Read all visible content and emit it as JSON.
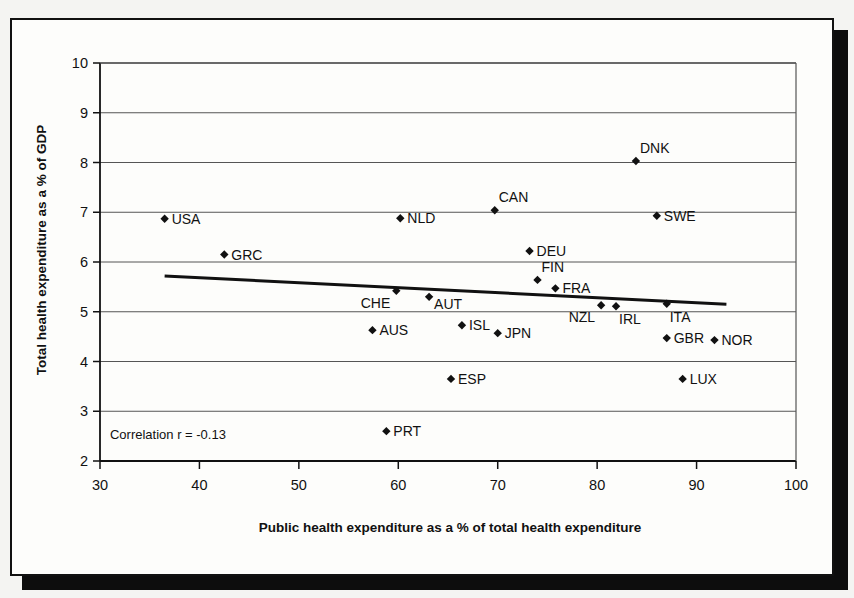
{
  "figure": {
    "background_color": "#fdfdfb",
    "border_color": "#111111",
    "annotation": "Correlation r = -0.13"
  },
  "chart_data": {
    "type": "scatter",
    "title": "",
    "xlabel": "Public health expenditure as a % of total health expenditure",
    "ylabel": "Total health expenditure as a % of GDP",
    "xlim": [
      30,
      100
    ],
    "ylim": [
      2,
      10
    ],
    "xticks": [
      30,
      40,
      50,
      60,
      70,
      80,
      90,
      100
    ],
    "yticks": [
      2,
      3,
      4,
      5,
      6,
      7,
      8,
      9,
      10
    ],
    "grid": "horizontal",
    "legend": "none",
    "annotations": [
      {
        "text": "Correlation r = -0.13",
        "x": 31.0,
        "y": 2.45
      }
    ],
    "trendline": {
      "type": "linear",
      "x_start": 36.5,
      "y_start": 5.72,
      "x_end": 93.0,
      "y_end": 5.15,
      "color": "#111111",
      "width": 3
    },
    "points": [
      {
        "label": "USA",
        "x": 36.5,
        "y": 6.87,
        "label_pos": "right"
      },
      {
        "label": "GRC",
        "x": 42.5,
        "y": 6.15,
        "label_pos": "right"
      },
      {
        "label": "AUS",
        "x": 57.4,
        "y": 4.63,
        "label_pos": "right"
      },
      {
        "label": "PRT",
        "x": 58.8,
        "y": 2.6,
        "label_pos": "right"
      },
      {
        "label": "CHE",
        "x": 59.8,
        "y": 5.42,
        "label_pos": "below-left"
      },
      {
        "label": "NLD",
        "x": 60.2,
        "y": 6.88,
        "label_pos": "right"
      },
      {
        "label": "AUT",
        "x": 63.1,
        "y": 5.3,
        "label_pos": "right-below"
      },
      {
        "label": "ESP",
        "x": 65.3,
        "y": 3.65,
        "label_pos": "right"
      },
      {
        "label": "ISL",
        "x": 66.4,
        "y": 4.73,
        "label_pos": "right"
      },
      {
        "label": "CAN",
        "x": 69.7,
        "y": 7.04,
        "label_pos": "above-right"
      },
      {
        "label": "JPN",
        "x": 70.0,
        "y": 4.57,
        "label_pos": "right"
      },
      {
        "label": "DEU",
        "x": 73.2,
        "y": 6.22,
        "label_pos": "right"
      },
      {
        "label": "FIN",
        "x": 74.0,
        "y": 5.64,
        "label_pos": "above-right"
      },
      {
        "label": "FRA",
        "x": 75.8,
        "y": 5.47,
        "label_pos": "right"
      },
      {
        "label": "NZL",
        "x": 80.4,
        "y": 5.13,
        "label_pos": "below-left"
      },
      {
        "label": "IRL",
        "x": 81.9,
        "y": 5.11,
        "label_pos": "below-right"
      },
      {
        "label": "DNK",
        "x": 83.9,
        "y": 8.03,
        "label_pos": "above-right"
      },
      {
        "label": "SWE",
        "x": 86.0,
        "y": 6.93,
        "label_pos": "right"
      },
      {
        "label": "ITA",
        "x": 87.0,
        "y": 5.16,
        "label_pos": "below-right"
      },
      {
        "label": "GBR",
        "x": 87.0,
        "y": 4.47,
        "label_pos": "right"
      },
      {
        "label": "LUX",
        "x": 88.6,
        "y": 3.65,
        "label_pos": "right"
      },
      {
        "label": "NOR",
        "x": 91.8,
        "y": 4.43,
        "label_pos": "right"
      }
    ]
  },
  "axis": {
    "x_tick_labels": [
      "30",
      "40",
      "50",
      "60",
      "70",
      "80",
      "90",
      "100"
    ],
    "y_tick_labels": [
      "2",
      "3",
      "4",
      "5",
      "6",
      "7",
      "8",
      "9",
      "10"
    ],
    "x_title": "Public health expenditure as a % of total health expenditure",
    "y_title": "Total health expenditure as a % of GDP"
  }
}
